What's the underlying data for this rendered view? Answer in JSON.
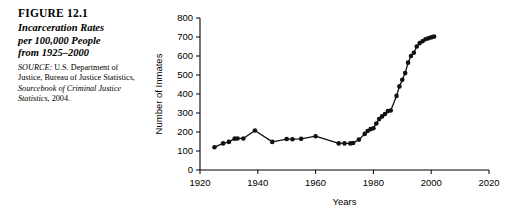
{
  "figure": {
    "label": "FIGURE 12.1",
    "title_lines": [
      "Incarceration Rates",
      "per 100,000 People",
      "from 1925–2000"
    ],
    "source_prefix": "SOURCE:",
    "source_text_1": " U.S. Department of Justice, Bureau of Justice Statistics, ",
    "source_italic": "Sourcebook of Criminal Justice Statistics",
    "source_text_2": ", 2004."
  },
  "chart_data": {
    "type": "line",
    "title": "",
    "xlabel": "Years",
    "ylabel": "Number of Inmates",
    "xlim": [
      1920,
      2020
    ],
    "ylim": [
      0,
      800
    ],
    "xticks": [
      1920,
      1940,
      1960,
      1980,
      2000,
      2020
    ],
    "yticks": [
      0,
      100,
      200,
      300,
      400,
      500,
      600,
      700,
      800
    ],
    "grid": false,
    "legend": "none",
    "marker": "filled-circle",
    "line_color": "#111111",
    "series": [
      {
        "name": "Incarceration rate per 100,000",
        "x": [
          1925,
          1928,
          1930,
          1932,
          1933,
          1935,
          1939,
          1945,
          1950,
          1952,
          1955,
          1960,
          1968,
          1970,
          1972,
          1973,
          1975,
          1977,
          1978,
          1979,
          1980,
          1981,
          1982,
          1983,
          1984,
          1985,
          1986,
          1988,
          1989,
          1990,
          1991,
          1992,
          1993,
          1994,
          1995,
          1996,
          1997,
          1998,
          1999,
          2000,
          2001
        ],
        "values": [
          120,
          140,
          148,
          165,
          166,
          166,
          208,
          148,
          163,
          162,
          164,
          178,
          140,
          140,
          140,
          142,
          160,
          190,
          205,
          215,
          220,
          245,
          268,
          282,
          295,
          310,
          313,
          390,
          440,
          475,
          510,
          565,
          600,
          617,
          650,
          668,
          678,
          688,
          693,
          698,
          702
        ]
      }
    ]
  }
}
